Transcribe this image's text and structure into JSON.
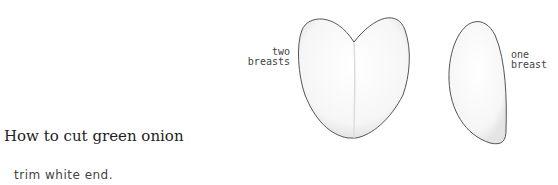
{
  "illustrations": {
    "two_breasts": {
      "label_line1": "two",
      "label_line2": "breasts"
    },
    "one_breast": {
      "label_line1": "one",
      "label_line2": "breast"
    }
  },
  "section": {
    "heading": "How to cut green onion",
    "caption": "trim white end."
  }
}
